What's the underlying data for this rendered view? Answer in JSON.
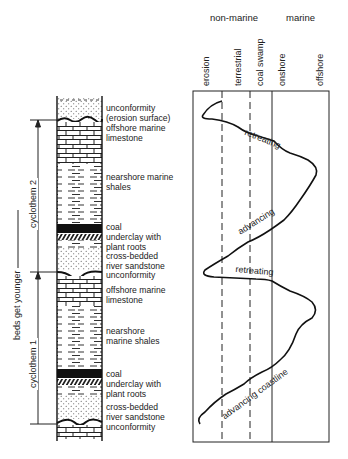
{
  "column": {
    "side_labels": {
      "beds_get_younger": "beds get younger",
      "cyclothem_2": "cyclothem 2",
      "cyclothem_1": "cyclothem 1"
    },
    "layers_top_cycle": [
      {
        "label": "unconformity"
      },
      {
        "label": "(erosion surface)"
      },
      {
        "label": "offshore marine"
      },
      {
        "label": "limestone"
      },
      {
        "label": "nearshore marine"
      },
      {
        "label": "shales"
      },
      {
        "label": "coal"
      },
      {
        "label": "underclay with"
      },
      {
        "label": "plant roots"
      },
      {
        "label": "cross-bedded"
      },
      {
        "label": "river sandstone"
      },
      {
        "label": "unconformity"
      }
    ],
    "layers_bottom_cycle": [
      {
        "label": "offshore marine"
      },
      {
        "label": "limestone"
      },
      {
        "label": "nearshore"
      },
      {
        "label": "marine shales"
      },
      {
        "label": "coal"
      },
      {
        "label": "underclay with"
      },
      {
        "label": "plant roots"
      },
      {
        "label": "cross-bedded"
      },
      {
        "label": "river sandstone"
      },
      {
        "label": "unconformity"
      }
    ]
  },
  "chart": {
    "group_headers": {
      "non_marine": "non-marine",
      "marine": "marine"
    },
    "columns": [
      "erosion",
      "terrestrial",
      "coal swamp",
      "onshore",
      "offshore"
    ],
    "curve_labels": {
      "retreating_1": "retreating",
      "advancing_1": "advancing",
      "retreating_2": "retreating",
      "advancing_2": "advancing coastline"
    }
  }
}
